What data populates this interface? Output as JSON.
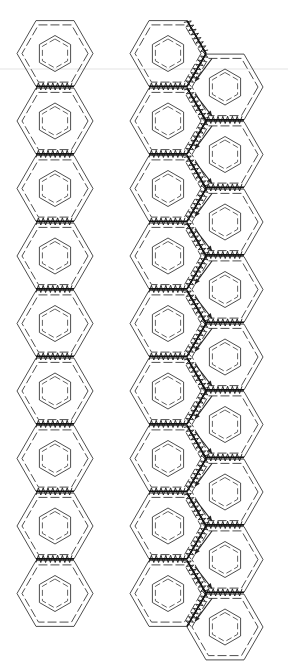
{
  "figure": {
    "colors": {
      "line": "#3a3a3a",
      "bond": "#111111",
      "guide": "#dcdcdc",
      "background": "#ffffff"
    },
    "hex_radius": 38,
    "ring_radius": 18,
    "vertical_pitch": 67.5,
    "left_chain": {
      "cx": 55,
      "first_cy": 53.5,
      "count": 9
    },
    "right_ribbon": {
      "column_a": {
        "cx": 168,
        "first_cy": 53.5,
        "count": 9
      },
      "column_b": {
        "cx": 225,
        "first_cy": 87,
        "count": 9
      },
      "arrow_icon": "down-arrow"
    },
    "guide_line_y": 69
  },
  "caption": ""
}
